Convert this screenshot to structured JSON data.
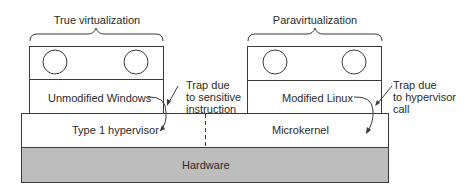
{
  "diagram": {
    "left_group": {
      "title": "True virtualization",
      "guest_os": "Unmodified Windows",
      "trap_note": [
        "Trap due",
        "to sensitive",
        "instruction"
      ]
    },
    "right_group": {
      "title": "Paravirtualization",
      "guest_os": "Modified Linux",
      "trap_note": [
        "Trap due",
        "to hypervisor",
        "call"
      ]
    },
    "layers": {
      "left_hypervisor": "Type 1 hypervisor",
      "right_hypervisor": "Microkernel",
      "hardware": "Hardware"
    },
    "colors": {
      "line": "#3a3a3a",
      "hardware_fill": "#bdbdbd",
      "background": "#ffffff"
    }
  }
}
